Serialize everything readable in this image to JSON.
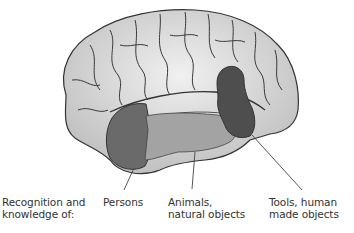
{
  "figure": {
    "type": "lateral view of brain with labeled temporal-lobe regions",
    "colors": {
      "brain_fill": "#d9d9d9",
      "sulci": "#333333",
      "persons_region": "#6a6a6a",
      "animals_region": "#a3a3a3",
      "tools_region": "#4e4e4e",
      "leader_line": "#444444"
    }
  },
  "labels": {
    "heading": {
      "line1": "Recognition and",
      "line2": "knowledge of:"
    },
    "persons": {
      "line1": "Persons"
    },
    "animals": {
      "line1": "Animals,",
      "line2": "natural objects"
    },
    "tools": {
      "line1": "Tools, human",
      "line2": "made objects"
    }
  }
}
